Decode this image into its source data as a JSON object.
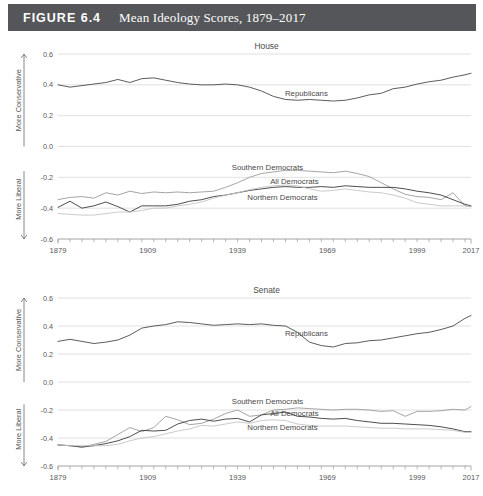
{
  "figure": {
    "number_label": "FIGURE 6.4",
    "title": "Mean Ideology Scores, 1879–2017",
    "header_bg": "#55565a",
    "header_text_color": "#ffffff"
  },
  "axis_labels": {
    "more_conservative": "More Conservative",
    "more_liberal": "More Liberal"
  },
  "chart_data": [
    {
      "type": "line",
      "title": "House",
      "xlabel": "",
      "ylabel": "",
      "xlim": [
        1879,
        2017
      ],
      "ylim": [
        -0.6,
        0.6
      ],
      "yticks": [
        0.6,
        0.4,
        0.2,
        0.0,
        -0.2,
        -0.4,
        -0.6
      ],
      "ytick_labels": [
        "0.6",
        "0.4",
        "0.2",
        "0.0",
        "-0.2",
        "-0.4",
        "-0.6"
      ],
      "xticks": [
        1879,
        1909,
        1939,
        1969,
        1999,
        2017
      ],
      "xtick_labels": [
        "1879",
        "1909",
        "1939",
        "1969",
        "1999",
        "2017"
      ],
      "minor_tick_step": 4,
      "grid": "horizontal",
      "legend": "inline-annotations",
      "x": [
        1879,
        1883,
        1887,
        1891,
        1895,
        1899,
        1903,
        1907,
        1911,
        1915,
        1919,
        1923,
        1927,
        1931,
        1935,
        1939,
        1943,
        1947,
        1951,
        1955,
        1959,
        1963,
        1967,
        1971,
        1975,
        1979,
        1983,
        1987,
        1991,
        1995,
        1999,
        2003,
        2007,
        2011,
        2015,
        2017
      ],
      "series": [
        {
          "name": "Republicans",
          "color": "#4a4a4a",
          "width": 0.9,
          "label_x": 1962,
          "label_y": 0.33,
          "values": [
            0.4,
            0.385,
            0.395,
            0.405,
            0.415,
            0.435,
            0.415,
            0.44,
            0.445,
            0.43,
            0.415,
            0.405,
            0.4,
            0.4,
            0.405,
            0.4,
            0.385,
            0.36,
            0.325,
            0.305,
            0.3,
            0.305,
            0.3,
            0.295,
            0.3,
            0.315,
            0.335,
            0.345,
            0.375,
            0.385,
            0.405,
            0.42,
            0.43,
            0.45,
            0.465,
            0.475
          ]
        },
        {
          "name": "Southern Democrats",
          "color": "#9b9b9b",
          "width": 0.9,
          "label_x": 1949,
          "label_y": -0.155,
          "values": [
            -0.345,
            -0.33,
            -0.325,
            -0.335,
            -0.3,
            -0.315,
            -0.29,
            -0.305,
            -0.295,
            -0.3,
            -0.295,
            -0.3,
            -0.295,
            -0.29,
            -0.265,
            -0.235,
            -0.2,
            -0.175,
            -0.165,
            -0.155,
            -0.155,
            -0.16,
            -0.165,
            -0.17,
            -0.16,
            -0.175,
            -0.195,
            -0.235,
            -0.275,
            -0.31,
            -0.325,
            -0.33,
            -0.345,
            -0.3,
            -0.385,
            -0.39
          ]
        },
        {
          "name": "All Democrats",
          "color": "#3a3a3a",
          "width": 0.9,
          "label_x": 1958,
          "label_y": -0.245,
          "values": [
            -0.395,
            -0.355,
            -0.4,
            -0.385,
            -0.36,
            -0.39,
            -0.425,
            -0.385,
            -0.385,
            -0.385,
            -0.375,
            -0.355,
            -0.345,
            -0.325,
            -0.315,
            -0.3,
            -0.285,
            -0.275,
            -0.265,
            -0.26,
            -0.265,
            -0.265,
            -0.26,
            -0.265,
            -0.255,
            -0.26,
            -0.265,
            -0.265,
            -0.265,
            -0.275,
            -0.29,
            -0.3,
            -0.315,
            -0.345,
            -0.375,
            -0.385
          ]
        },
        {
          "name": "Northern Democrats",
          "color": "#c4c4c4",
          "width": 0.9,
          "label_x": 1954,
          "label_y": -0.345,
          "values": [
            -0.435,
            -0.44,
            -0.445,
            -0.445,
            -0.435,
            -0.425,
            -0.425,
            -0.415,
            -0.4,
            -0.4,
            -0.385,
            -0.375,
            -0.36,
            -0.335,
            -0.315,
            -0.3,
            -0.28,
            -0.265,
            -0.255,
            -0.25,
            -0.255,
            -0.275,
            -0.29,
            -0.285,
            -0.275,
            -0.285,
            -0.295,
            -0.3,
            -0.315,
            -0.335,
            -0.365,
            -0.375,
            -0.385,
            -0.385,
            -0.385,
            -0.39
          ]
        }
      ]
    },
    {
      "type": "line",
      "title": "Senate",
      "xlabel": "",
      "ylabel": "",
      "xlim": [
        1879,
        2017
      ],
      "ylim": [
        -0.6,
        0.6
      ],
      "yticks": [
        0.6,
        0.4,
        0.2,
        0.0,
        -0.2,
        -0.4,
        -0.6
      ],
      "ytick_labels": [
        "0.6",
        "0.4",
        "0.2",
        "0.0",
        "-0.2",
        "-0.4",
        "-0.6"
      ],
      "xticks": [
        1879,
        1909,
        1939,
        1969,
        1999,
        2017
      ],
      "xtick_labels": [
        "1879",
        "1909",
        "1939",
        "1969",
        "1999",
        "2017"
      ],
      "minor_tick_step": 4,
      "grid": "horizontal",
      "legend": "inline-annotations",
      "x": [
        1879,
        1883,
        1887,
        1891,
        1895,
        1899,
        1903,
        1907,
        1911,
        1915,
        1919,
        1923,
        1927,
        1931,
        1935,
        1939,
        1943,
        1947,
        1951,
        1955,
        1959,
        1963,
        1967,
        1971,
        1975,
        1979,
        1983,
        1987,
        1991,
        1995,
        1999,
        2003,
        2007,
        2011,
        2015,
        2017
      ],
      "series": [
        {
          "name": "Republicans",
          "color": "#4a4a4a",
          "width": 0.9,
          "label_x": 1962,
          "label_y": 0.33,
          "values": [
            0.29,
            0.305,
            0.29,
            0.275,
            0.285,
            0.3,
            0.335,
            0.385,
            0.4,
            0.41,
            0.43,
            0.425,
            0.415,
            0.405,
            0.41,
            0.415,
            0.41,
            0.415,
            0.405,
            0.4,
            0.355,
            0.285,
            0.26,
            0.25,
            0.275,
            0.28,
            0.295,
            0.3,
            0.315,
            0.33,
            0.345,
            0.355,
            0.375,
            0.4,
            0.455,
            0.475
          ]
        },
        {
          "name": "Southern Democrats",
          "color": "#9b9b9b",
          "width": 0.9,
          "label_x": 1949,
          "label_y": -0.155,
          "values": [
            -0.45,
            -0.455,
            -0.465,
            -0.445,
            -0.425,
            -0.375,
            -0.325,
            -0.355,
            -0.325,
            -0.245,
            -0.27,
            -0.305,
            -0.295,
            -0.265,
            -0.225,
            -0.2,
            -0.245,
            -0.235,
            -0.2,
            -0.195,
            -0.185,
            -0.19,
            -0.195,
            -0.2,
            -0.195,
            -0.195,
            -0.2,
            -0.21,
            -0.205,
            -0.245,
            -0.21,
            -0.21,
            -0.205,
            -0.195,
            -0.2,
            -0.175
          ]
        },
        {
          "name": "All Democrats",
          "color": "#3a3a3a",
          "width": 0.9,
          "label_x": 1958,
          "label_y": -0.245,
          "values": [
            -0.45,
            -0.455,
            -0.465,
            -0.455,
            -0.44,
            -0.42,
            -0.39,
            -0.345,
            -0.35,
            -0.345,
            -0.3,
            -0.275,
            -0.265,
            -0.28,
            -0.265,
            -0.26,
            -0.285,
            -0.235,
            -0.225,
            -0.215,
            -0.245,
            -0.25,
            -0.26,
            -0.265,
            -0.26,
            -0.275,
            -0.285,
            -0.295,
            -0.295,
            -0.3,
            -0.305,
            -0.31,
            -0.32,
            -0.335,
            -0.355,
            -0.355
          ]
        },
        {
          "name": "Northern Democrats",
          "color": "#c4c4c4",
          "width": 0.9,
          "label_x": 1954,
          "label_y": -0.345,
          "values": [
            -0.45,
            -0.455,
            -0.455,
            -0.455,
            -0.455,
            -0.445,
            -0.42,
            -0.4,
            -0.39,
            -0.37,
            -0.35,
            -0.335,
            -0.31,
            -0.315,
            -0.3,
            -0.285,
            -0.295,
            -0.275,
            -0.27,
            -0.275,
            -0.3,
            -0.31,
            -0.315,
            -0.315,
            -0.315,
            -0.32,
            -0.325,
            -0.33,
            -0.33,
            -0.335,
            -0.335,
            -0.335,
            -0.34,
            -0.345,
            -0.36,
            -0.36
          ]
        }
      ]
    }
  ]
}
